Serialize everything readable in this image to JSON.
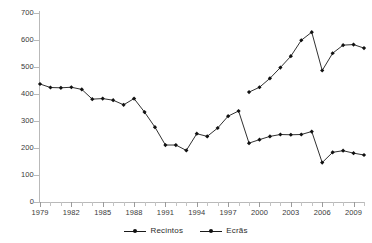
{
  "chart_data": {
    "type": "line",
    "title": "",
    "subtitle": "",
    "xlabel": "",
    "ylabel": "",
    "ylim": [
      0,
      700
    ],
    "ytick_step": 100,
    "yticks": [
      0,
      100,
      200,
      300,
      400,
      500,
      600,
      700
    ],
    "xlim": [
      1979,
      2010
    ],
    "xtick_labels": [
      "1979",
      "1982",
      "1985",
      "1988",
      "1991",
      "1994",
      "1997",
      "2000",
      "2003",
      "2006",
      "2009"
    ],
    "xtick_label_years": [
      1979,
      1982,
      1985,
      1988,
      1991,
      1994,
      1997,
      2000,
      2003,
      2006,
      2009
    ],
    "grid": false,
    "legend_position": "bottom",
    "x": [
      1979,
      1980,
      1981,
      1982,
      1983,
      1984,
      1985,
      1986,
      1987,
      1988,
      1989,
      1990,
      1991,
      1992,
      1993,
      1994,
      1995,
      1996,
      1997,
      1998,
      1999,
      2000,
      2001,
      2002,
      2003,
      2004,
      2005,
      2006,
      2007,
      2008,
      2009,
      2010
    ],
    "series": [
      {
        "name": "Recintos",
        "color": "#1a1a1a",
        "marker": "diamond",
        "values": [
          437,
          424,
          423,
          425,
          417,
          381,
          383,
          377,
          360,
          383,
          333,
          277,
          211,
          211,
          191,
          253,
          243,
          274,
          318,
          337,
          218,
          231,
          243,
          250,
          249,
          250,
          261,
          146,
          184,
          190,
          181,
          174
        ]
      },
      {
        "name": "Ecrãs",
        "color": "#1a1a1a",
        "marker": "diamond",
        "values": [
          null,
          null,
          null,
          null,
          null,
          null,
          null,
          null,
          null,
          null,
          null,
          null,
          null,
          null,
          null,
          null,
          null,
          null,
          null,
          null,
          407,
          425,
          458,
          498,
          540,
          599,
          629,
          487,
          551,
          581,
          583,
          570
        ]
      }
    ]
  },
  "legend": {
    "items": [
      {
        "label": "Recintos",
        "marker_name": "legend-marker-recintos"
      },
      {
        "label": "Ecrãs",
        "marker_name": "legend-marker-ecras"
      }
    ]
  },
  "axes": {
    "y_labels": [
      "700",
      "600",
      "500",
      "400",
      "300",
      "200",
      "100",
      "0"
    ],
    "x_labels": [
      "1979",
      "1982",
      "1985",
      "1988",
      "1991",
      "1994",
      "1997",
      "2000",
      "2003",
      "2006",
      "2009"
    ]
  }
}
